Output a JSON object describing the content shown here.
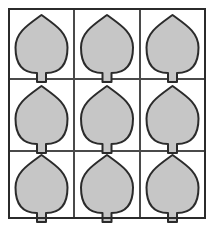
{
  "figure": {
    "background_color": "#ffffff",
    "grid": {
      "rows": 3,
      "columns": 3,
      "cell_count": 9,
      "outer_border_color": "#2b2b2b",
      "outer_border_width": 2,
      "inner_line_color": "#4a4a4a",
      "inner_line_width": 2,
      "x_left": 9,
      "x_right": 205,
      "y_top": 9,
      "y_bottom": 218,
      "column_edges": [
        9,
        74,
        140,
        205
      ],
      "row_edges": [
        9,
        79,
        151,
        218
      ]
    },
    "shape": {
      "name": "leaf",
      "fill_color": "#c6c6c6",
      "stroke_color": "#2b2b2b",
      "stroke_width": 2,
      "stem": {
        "name": "stem",
        "fill_color": "#c6c6c6",
        "width": 9,
        "height": 9
      }
    },
    "cells": [
      {
        "id": "cell-r1c1",
        "row": 1,
        "col": 1,
        "label": "leaf-1",
        "cx": 41.5,
        "cy": 44,
        "w": 52,
        "h": 58
      },
      {
        "id": "cell-r1c2",
        "row": 1,
        "col": 2,
        "label": "leaf-2",
        "cx": 107,
        "cy": 44,
        "w": 52,
        "h": 58
      },
      {
        "id": "cell-r1c3",
        "row": 1,
        "col": 3,
        "label": "leaf-3",
        "cx": 172.5,
        "cy": 44,
        "w": 52,
        "h": 58
      },
      {
        "id": "cell-r2c1",
        "row": 2,
        "col": 1,
        "label": "leaf-4",
        "cx": 41.5,
        "cy": 115,
        "w": 52,
        "h": 58
      },
      {
        "id": "cell-r2c2",
        "row": 2,
        "col": 2,
        "label": "leaf-5",
        "cx": 107,
        "cy": 115,
        "w": 52,
        "h": 58
      },
      {
        "id": "cell-r2c3",
        "row": 2,
        "col": 3,
        "label": "leaf-6",
        "cx": 172.5,
        "cy": 115,
        "w": 52,
        "h": 58
      },
      {
        "id": "cell-r3c1",
        "row": 3,
        "col": 1,
        "label": "leaf-7",
        "cx": 41.5,
        "cy": 184,
        "w": 52,
        "h": 58
      },
      {
        "id": "cell-r3c2",
        "row": 3,
        "col": 2,
        "label": "leaf-8",
        "cx": 107,
        "cy": 184,
        "w": 52,
        "h": 58
      },
      {
        "id": "cell-r3c3",
        "row": 3,
        "col": 3,
        "label": "leaf-9",
        "cx": 172.5,
        "cy": 184,
        "w": 52,
        "h": 58
      }
    ]
  }
}
